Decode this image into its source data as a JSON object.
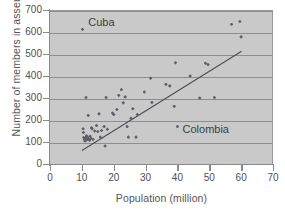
{
  "chart_data": {
    "type": "scatter",
    "title": "",
    "xlabel": "Population (million)",
    "ylabel": "Number of members in assembly",
    "xlim": [
      0,
      70
    ],
    "ylim": [
      0,
      700
    ],
    "xticks": [
      0,
      10,
      20,
      30,
      40,
      50,
      60,
      70
    ],
    "yticks": [
      0,
      100,
      200,
      300,
      400,
      500,
      600,
      700
    ],
    "grid": "horizontal",
    "legend": "none",
    "marker": "diamond",
    "marker_color": "#5e5e6a",
    "plot_background": "#c9c9c9",
    "gridline_color": "#8e8e8e",
    "points": [
      [
        10.2,
        612
      ],
      [
        10.4,
        160
      ],
      [
        10.5,
        143
      ],
      [
        10.6,
        120
      ],
      [
        10.8,
        112
      ],
      [
        11.0,
        105
      ],
      [
        11.2,
        118
      ],
      [
        11.3,
        302
      ],
      [
        11.4,
        128
      ],
      [
        11.6,
        110
      ],
      [
        11.8,
        122
      ],
      [
        12.0,
        221
      ],
      [
        12.2,
        113
      ],
      [
        12.4,
        108
      ],
      [
        12.6,
        126
      ],
      [
        12.8,
        117
      ],
      [
        13.0,
        165
      ],
      [
        13.2,
        160
      ],
      [
        13.5,
        112
      ],
      [
        14.0,
        150
      ],
      [
        14.6,
        175
      ],
      [
        15.0,
        148
      ],
      [
        15.4,
        228
      ],
      [
        15.8,
        122
      ],
      [
        16.2,
        152
      ],
      [
        17.0,
        170
      ],
      [
        17.3,
        82
      ],
      [
        17.6,
        302
      ],
      [
        18.0,
        158
      ],
      [
        19.6,
        232
      ],
      [
        20.0,
        225
      ],
      [
        21.0,
        248
      ],
      [
        21.6,
        312
      ],
      [
        22.4,
        338
      ],
      [
        23.0,
        278
      ],
      [
        23.6,
        305
      ],
      [
        24.2,
        170
      ],
      [
        24.6,
        122
      ],
      [
        25.4,
        208
      ],
      [
        26.0,
        251
      ],
      [
        27.0,
        122
      ],
      [
        27.4,
        225
      ],
      [
        29.6,
        327
      ],
      [
        31.6,
        390
      ],
      [
        32.0,
        280
      ],
      [
        36.4,
        362
      ],
      [
        37.6,
        355
      ],
      [
        39.0,
        262
      ],
      [
        39.4,
        460
      ],
      [
        40.0,
        170
      ],
      [
        44.0,
        400
      ],
      [
        47.0,
        300
      ],
      [
        48.8,
        458
      ],
      [
        49.6,
        452
      ],
      [
        51.6,
        302
      ],
      [
        57.0,
        635
      ],
      [
        59.6,
        648
      ],
      [
        60.0,
        578
      ]
    ],
    "trend_line": {
      "x": [
        10.0,
        60.0
      ],
      "y": [
        65,
        515
      ]
    },
    "annotations": [
      {
        "text": "Cuba",
        "x": 12.0,
        "y": 640,
        "point": [
          10.2,
          612
        ]
      },
      {
        "text": "Colombia",
        "x": 41.6,
        "y": 155,
        "point": [
          40.0,
          170
        ]
      }
    ]
  }
}
